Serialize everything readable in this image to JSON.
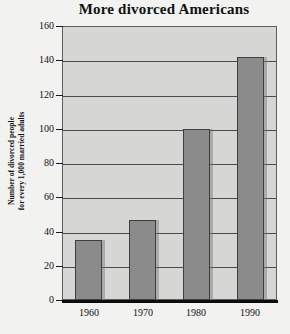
{
  "chart_data": {
    "type": "bar",
    "title": "More  divorced Americans",
    "xlabel": "",
    "ylabel": "Number of divorced people for every 1,000 married adults",
    "ylabel_lines": [
      "Number of divorced people",
      "for every 1,000 married adults"
    ],
    "categories": [
      "1960",
      "1970",
      "1980",
      "1990"
    ],
    "values": [
      35,
      47,
      100,
      142
    ],
    "ylim": [
      0,
      160
    ],
    "ytick_values": [
      0,
      20,
      40,
      60,
      80,
      100,
      120,
      140,
      160
    ],
    "ytick_labels": [
      "0",
      "20",
      "40",
      "60",
      "80",
      "100",
      "120",
      "140",
      "160"
    ],
    "grid": true,
    "legend": "none",
    "series": [
      {
        "name": "Divorced people per 1,000 married adults",
        "values": [
          35,
          47,
          100,
          142
        ]
      }
    ],
    "colors": {
      "bar_fill": "#8b8b8b",
      "bar_edge": "#3e3e3e",
      "plot_background": "#d6d6d4",
      "page_background": "#f2f2f0",
      "gridline": "#4a4a4a",
      "axis": "#0d0d0d",
      "text": "#111111"
    }
  }
}
